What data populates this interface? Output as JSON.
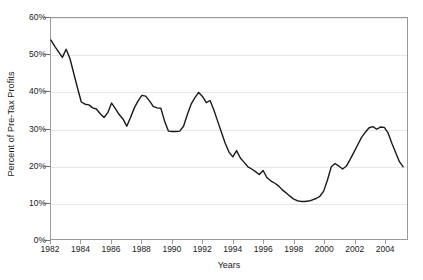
{
  "chart_data": {
    "type": "line",
    "title": "",
    "xlabel": "Years",
    "ylabel": "Percent of Pre-Tax Profits",
    "xlim": [
      1982,
      2005.5
    ],
    "ylim": [
      0,
      60
    ],
    "grid": true,
    "legend": false,
    "line_color": "#1a1a1a",
    "frame_color": "#9a9a9a",
    "grid_color": "#e8e8e8",
    "ytick_labels": [
      "0%",
      "10%",
      "20%",
      "30%",
      "40%",
      "50%",
      "60%"
    ],
    "ytick_values": [
      0,
      10,
      20,
      30,
      40,
      50,
      60
    ],
    "xtick_labels": [
      "1982",
      "1984",
      "1986",
      "1988",
      "1990",
      "1992",
      "1994",
      "1996",
      "1998",
      "2000",
      "2002",
      "2004"
    ],
    "xtick_values": [
      1982,
      1984,
      1986,
      1988,
      1990,
      1992,
      1994,
      1996,
      1998,
      2000,
      2002,
      2004
    ],
    "x": [
      1982.0,
      1982.25,
      1982.5,
      1982.75,
      1983.0,
      1983.25,
      1983.5,
      1983.75,
      1984.0,
      1984.25,
      1984.5,
      1984.75,
      1985.0,
      1985.25,
      1985.5,
      1985.75,
      1986.0,
      1986.25,
      1986.5,
      1986.75,
      1987.0,
      1987.25,
      1987.5,
      1987.75,
      1988.0,
      1988.25,
      1988.5,
      1988.75,
      1989.0,
      1989.25,
      1989.5,
      1989.75,
      1990.0,
      1990.25,
      1990.5,
      1990.75,
      1991.0,
      1991.25,
      1991.5,
      1991.75,
      1992.0,
      1992.25,
      1992.5,
      1992.75,
      1993.0,
      1993.25,
      1993.5,
      1993.75,
      1994.0,
      1994.25,
      1994.5,
      1994.75,
      1995.0,
      1995.25,
      1995.5,
      1995.75,
      1996.0,
      1996.25,
      1996.5,
      1996.75,
      1997.0,
      1997.25,
      1997.5,
      1997.75,
      1998.0,
      1998.25,
      1998.5,
      1998.75,
      1999.0,
      1999.25,
      1999.5,
      1999.75,
      2000.0,
      2000.25,
      2000.5,
      2000.75,
      2001.0,
      2001.25,
      2001.5,
      2001.75,
      2002.0,
      2002.25,
      2002.5,
      2002.75,
      2003.0,
      2003.25,
      2003.5,
      2003.75,
      2004.0,
      2004.25,
      2004.5,
      2004.75,
      2005.0,
      2005.25
    ],
    "values": [
      54.0,
      52.3,
      50.8,
      49.3,
      51.5,
      49.0,
      45.0,
      41.0,
      37.2,
      36.6,
      36.4,
      35.6,
      35.3,
      34.0,
      33.0,
      34.3,
      36.9,
      35.4,
      33.8,
      32.6,
      30.6,
      33.0,
      35.6,
      37.5,
      39.0,
      38.8,
      37.5,
      36.0,
      35.6,
      35.5,
      32.0,
      29.3,
      29.2,
      29.2,
      29.3,
      30.6,
      33.8,
      36.6,
      38.4,
      39.8,
      38.7,
      37.0,
      37.6,
      35.0,
      32.0,
      29.0,
      26.0,
      23.6,
      22.3,
      24.0,
      22.0,
      20.8,
      19.6,
      19.0,
      18.3,
      17.5,
      18.6,
      16.7,
      15.8,
      15.2,
      14.5,
      13.4,
      12.6,
      11.7,
      10.9,
      10.4,
      10.2,
      10.2,
      10.3,
      10.6,
      11.0,
      11.6,
      13.0,
      16.0,
      19.6,
      20.5,
      19.8,
      19.0,
      19.8,
      21.6,
      23.6,
      25.6,
      27.6,
      29.0,
      30.2,
      30.5,
      29.8,
      30.4,
      30.3,
      28.8,
      26.0,
      23.5,
      21.0,
      19.6
    ],
    "series_note": "Single black line series"
  }
}
